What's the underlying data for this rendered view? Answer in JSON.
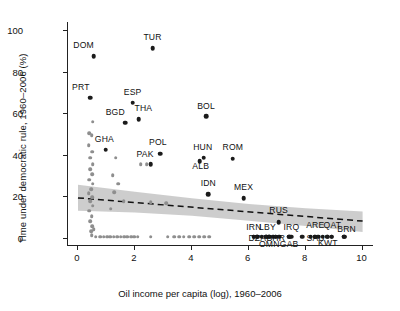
{
  "chart_data": {
    "type": "scatter",
    "title": "",
    "xlabel": "Oil income per capita (log), 1960–2006",
    "ylabel": "Time under democratic rule, 1960–2006 (%)",
    "xlim": [
      -0.35,
      10.4
    ],
    "ylim": [
      -4,
      104
    ],
    "xticks": [
      0,
      2,
      4,
      6,
      8,
      10
    ],
    "yticks": [
      0,
      20,
      40,
      60,
      80,
      100
    ],
    "grid": false,
    "legend": null,
    "colors": {
      "point_dark": "#1b1b1b",
      "point_gray": "#8e8e8e",
      "band": "#c9c9c9",
      "trend_line": "#111111",
      "axis": "#222222"
    },
    "trend_line": {
      "style": "dashed",
      "x": [
        0.0,
        10.0
      ],
      "y": [
        19.2,
        8.0
      ]
    },
    "confidence_band": {
      "x": [
        0.0,
        2.0,
        4.0,
        6.0,
        8.0,
        10.0
      ],
      "upper": [
        25.5,
        22.2,
        19.0,
        16.3,
        14.2,
        12.6
      ],
      "lower": [
        13.0,
        12.2,
        10.6,
        8.2,
        5.6,
        2.8
      ]
    },
    "labeled_points": [
      {
        "label": "DOM",
        "x": 0.55,
        "y": 87.5,
        "label_dx": -1.0,
        "label_dy": 6.0
      },
      {
        "label": "TUR",
        "x": 2.62,
        "y": 91.5,
        "label_dx": 0.0,
        "label_dy": 6.0
      },
      {
        "label": "PRT",
        "x": 0.42,
        "y": 67.5,
        "label_dx": -0.9,
        "label_dy": 6.0
      },
      {
        "label": "ESP",
        "x": 1.92,
        "y": 65.0,
        "label_dx": 0.0,
        "label_dy": 6.0
      },
      {
        "label": "BGD",
        "x": 1.66,
        "y": 55.5,
        "label_dx": -1.0,
        "label_dy": 5.5
      },
      {
        "label": "THA",
        "x": 2.14,
        "y": 57.0,
        "label_dx": 0.45,
        "label_dy": 6.5
      },
      {
        "label": "BOL",
        "x": 4.5,
        "y": 58.5,
        "label_dx": 0.0,
        "label_dy": 6.0
      },
      {
        "label": "GHA",
        "x": 0.98,
        "y": 42.5,
        "label_dx": -0.15,
        "label_dy": 6.0
      },
      {
        "label": "POL",
        "x": 2.88,
        "y": 40.5,
        "label_dx": -0.2,
        "label_dy": 6.5
      },
      {
        "label": "PAK",
        "x": 2.55,
        "y": 35.5,
        "label_dx": -0.55,
        "label_dy": 5.5
      },
      {
        "label": "HUN",
        "x": 4.42,
        "y": 38.5,
        "label_dx": -0.1,
        "label_dy": 6.0
      },
      {
        "label": "ALB",
        "x": 4.28,
        "y": 37.0,
        "label_dx": 0.1,
        "label_dy": -7.5
      },
      {
        "label": "ROM",
        "x": 5.44,
        "y": 38.0,
        "label_dx": 0.0,
        "label_dy": 6.5
      },
      {
        "label": "IDN",
        "x": 4.58,
        "y": 21.0,
        "label_dx": 0.0,
        "label_dy": 6.5
      },
      {
        "label": "MEX",
        "x": 5.82,
        "y": 19.0,
        "label_dx": 0.0,
        "label_dy": 6.5
      },
      {
        "label": "RUS",
        "x": 7.05,
        "y": 7.5,
        "label_dx": 0.0,
        "label_dy": 7.0
      },
      {
        "label": "IRN",
        "x": 6.18,
        "y": 0.5,
        "label_dx": 0.0,
        "label_dy": 5.0
      },
      {
        "label": "LBY",
        "x": 6.62,
        "y": 0.5,
        "label_dx": 0.1,
        "label_dy": 5.0
      },
      {
        "label": "IRQ",
        "x": 7.5,
        "y": 0.5,
        "label_dx": 0.0,
        "label_dy": 5.0
      },
      {
        "label": "ARE",
        "x": 8.32,
        "y": 0.5,
        "label_dx": 0.05,
        "label_dy": 7.0
      },
      {
        "label": "QAT",
        "x": 8.92,
        "y": 0.5,
        "label_dx": 0.05,
        "label_dy": 7.0
      },
      {
        "label": "BRN",
        "x": 9.35,
        "y": 0.5,
        "label_dx": 0.25,
        "label_dy": 3.0
      },
      {
        "label": "DZA",
        "x": 6.3,
        "y": 0.5,
        "label_dx": 0.0,
        "label_dy": -5.0
      },
      {
        "label": "BHR",
        "x": 6.95,
        "y": 0.5,
        "label_dx": 0.0,
        "label_dy": -5.0
      },
      {
        "label": "SAU",
        "x": 8.35,
        "y": 0.5,
        "label_dx": 0.0,
        "label_dy": -5.0
      },
      {
        "label": "OMN",
        "x": 6.72,
        "y": 0.5,
        "label_dx": 0.0,
        "label_dy": -10.0
      },
      {
        "label": "GAB",
        "x": 7.42,
        "y": 0.5,
        "label_dx": 0.0,
        "label_dy": -10.0
      },
      {
        "label": "KWT",
        "x": 8.78,
        "y": 0.5,
        "label_dx": 0.0,
        "label_dy": -9.0
      }
    ],
    "unlabeled_points": [
      {
        "x": 0.52,
        "y": 56.0
      },
      {
        "x": 0.4,
        "y": 50.5
      },
      {
        "x": 0.48,
        "y": 49.5
      },
      {
        "x": 0.38,
        "y": 44.5
      },
      {
        "x": 0.5,
        "y": 41.5
      },
      {
        "x": 0.42,
        "y": 38.5
      },
      {
        "x": 0.52,
        "y": 35.5
      },
      {
        "x": 0.44,
        "y": 33.0
      },
      {
        "x": 0.5,
        "y": 30.5
      },
      {
        "x": 0.4,
        "y": 28.0
      },
      {
        "x": 0.52,
        "y": 26.0
      },
      {
        "x": 0.46,
        "y": 23.5
      },
      {
        "x": 0.38,
        "y": 21.5
      },
      {
        "x": 0.5,
        "y": 19.5
      },
      {
        "x": 0.44,
        "y": 17.5
      },
      {
        "x": 0.52,
        "y": 15.5
      },
      {
        "x": 0.4,
        "y": 13.0
      },
      {
        "x": 0.48,
        "y": 10.5
      },
      {
        "x": 0.42,
        "y": 8.0
      },
      {
        "x": 0.5,
        "y": 5.5
      },
      {
        "x": 0.46,
        "y": 3.0
      },
      {
        "x": 1.32,
        "y": 38.5
      },
      {
        "x": 1.22,
        "y": 30.0
      },
      {
        "x": 1.42,
        "y": 26.0
      },
      {
        "x": 1.28,
        "y": 22.0
      },
      {
        "x": 1.6,
        "y": 17.5
      },
      {
        "x": 1.15,
        "y": 14.0
      },
      {
        "x": 2.2,
        "y": 35.5
      },
      {
        "x": 2.42,
        "y": 35.5
      },
      {
        "x": 2.55,
        "y": 17.0
      },
      {
        "x": 3.1,
        "y": 16.5
      },
      {
        "x": 0.62,
        "y": 0.5
      },
      {
        "x": 0.78,
        "y": 0.5
      },
      {
        "x": 0.9,
        "y": 0.5
      },
      {
        "x": 1.02,
        "y": 0.5
      },
      {
        "x": 1.14,
        "y": 0.5
      },
      {
        "x": 1.26,
        "y": 0.5
      },
      {
        "x": 1.38,
        "y": 0.5
      },
      {
        "x": 1.5,
        "y": 0.5
      },
      {
        "x": 1.62,
        "y": 0.5
      },
      {
        "x": 1.74,
        "y": 0.5
      },
      {
        "x": 1.86,
        "y": 0.5
      },
      {
        "x": 1.98,
        "y": 0.5
      },
      {
        "x": 2.1,
        "y": 0.5
      },
      {
        "x": 2.55,
        "y": 0.5
      },
      {
        "x": 3.15,
        "y": 0.5
      },
      {
        "x": 3.38,
        "y": 0.5
      },
      {
        "x": 3.55,
        "y": 0.5
      },
      {
        "x": 3.72,
        "y": 0.5
      },
      {
        "x": 3.9,
        "y": 0.5
      },
      {
        "x": 4.08,
        "y": 0.5
      },
      {
        "x": 4.26,
        "y": 0.5
      },
      {
        "x": 4.44,
        "y": 0.5
      },
      {
        "x": 4.62,
        "y": 0.5
      },
      {
        "x": 0.48,
        "y": 1.2
      },
      {
        "x": 0.55,
        "y": 4.0
      }
    ],
    "zero_row_dark": [
      {
        "x": 6.18,
        "y": 0.5
      },
      {
        "x": 6.3,
        "y": 0.5
      },
      {
        "x": 6.45,
        "y": 0.5
      },
      {
        "x": 6.62,
        "y": 0.5
      },
      {
        "x": 6.72,
        "y": 0.5
      },
      {
        "x": 6.85,
        "y": 0.5
      },
      {
        "x": 6.95,
        "y": 0.5
      },
      {
        "x": 7.08,
        "y": 0.5
      },
      {
        "x": 7.42,
        "y": 0.5
      },
      {
        "x": 7.88,
        "y": 0.5
      },
      {
        "x": 8.18,
        "y": 0.5
      },
      {
        "x": 8.32,
        "y": 0.5
      },
      {
        "x": 8.45,
        "y": 0.5
      },
      {
        "x": 8.6,
        "y": 0.5
      },
      {
        "x": 8.75,
        "y": 0.5
      },
      {
        "x": 8.92,
        "y": 0.5
      },
      {
        "x": 9.35,
        "y": 0.5
      }
    ]
  }
}
